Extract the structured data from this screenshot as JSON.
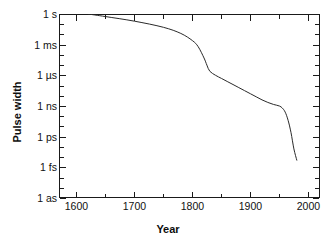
{
  "chart_data": {
    "type": "line",
    "title": "",
    "xlabel": "Year",
    "ylabel": "Pulse width",
    "xlim": [
      1570,
      2020
    ],
    "ylim_log10_seconds": [
      -18,
      0
    ],
    "grid": false,
    "legend": "none",
    "x_ticks": [
      1600,
      1700,
      1800,
      1900,
      2000
    ],
    "x_tick_labels": [
      "1600",
      "1700",
      "1800",
      "1900",
      "2000"
    ],
    "x_minor_tick_interval": 50,
    "y_ticks_log10_seconds": [
      0,
      -3,
      -6,
      -9,
      -12,
      -15,
      -18
    ],
    "y_tick_labels": [
      "1 s",
      "1 ms",
      "1 µs",
      "1 ns",
      "1 ps",
      "1 fs",
      "1 as"
    ],
    "y_minor_ticks_per_decade": 3,
    "line_color": "#2a2a2a",
    "line_width_px": 1,
    "series": [
      {
        "name": "Shortest controlled pulse width",
        "x": [
          1620,
          1650,
          1700,
          1750,
          1780,
          1800,
          1810,
          1820,
          1825,
          1830,
          1840,
          1850,
          1860,
          1870,
          1880,
          1890,
          1900,
          1910,
          1920,
          1930,
          1940,
          1950,
          1955,
          1960,
          1965,
          1970,
          1975,
          1980
        ],
        "y_log10_seconds": [
          0.0,
          -0.25,
          -0.7,
          -1.3,
          -1.9,
          -2.6,
          -3.2,
          -4.3,
          -5.0,
          -5.6,
          -6.0,
          -6.3,
          -6.6,
          -6.9,
          -7.2,
          -7.5,
          -7.8,
          -8.1,
          -8.4,
          -8.65,
          -8.85,
          -9.0,
          -9.2,
          -9.6,
          -10.4,
          -11.6,
          -13.2,
          -14.3
        ],
        "y_values_labeled": [
          "1 s at 1620",
          "~1 µs plateau near 1830",
          "~1 ns plateau near 1950",
          "below 1 ps by 1980"
        ]
      }
    ]
  },
  "axes": {
    "x_title": "Year",
    "y_title": "Pulse width"
  }
}
